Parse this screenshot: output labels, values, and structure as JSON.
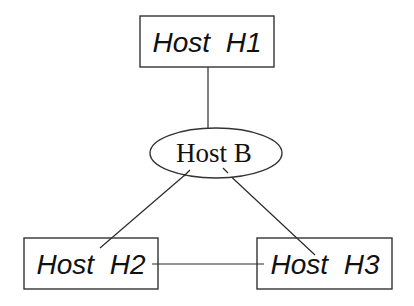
{
  "diagram": {
    "type": "network-topology",
    "nodes": [
      {
        "id": "H1",
        "label": "Host  H1",
        "shape": "rectangle"
      },
      {
        "id": "B",
        "label": "Host B",
        "shape": "ellipse"
      },
      {
        "id": "H2",
        "label": "Host  H2",
        "shape": "rectangle"
      },
      {
        "id": "H3",
        "label": "Host  H3",
        "shape": "rectangle"
      }
    ],
    "edges": [
      {
        "from": "H1",
        "to": "B"
      },
      {
        "from": "B",
        "to": "H2"
      },
      {
        "from": "B",
        "to": "H3"
      },
      {
        "from": "H2",
        "to": "H3"
      }
    ],
    "colors": {
      "stroke": "#333333",
      "text": "#111111",
      "background": "#ffffff"
    }
  }
}
